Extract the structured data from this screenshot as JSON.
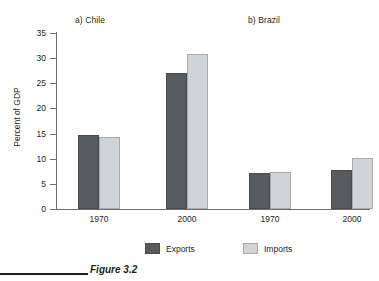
{
  "figure": {
    "caption": "Figure 3.2",
    "caption_rule": true
  },
  "legend": {
    "position": "bottom",
    "items": [
      {
        "label": "Exports",
        "color": "#595a5c"
      },
      {
        "label": "Imports",
        "color": "#d2d3d5"
      }
    ]
  },
  "chart_data": {
    "type": "bar",
    "title": "",
    "xlabel": "",
    "ylabel": "Percent of GDP",
    "ylim": [
      0,
      35
    ],
    "yticks": [
      0,
      5,
      10,
      15,
      20,
      25,
      30,
      35
    ],
    "ytick_labels": [
      "0",
      "5",
      "10",
      "15",
      "20",
      "25",
      "30",
      "35"
    ],
    "grid": false,
    "legend_position": "bottom",
    "panels": [
      {
        "title": "a) Chile",
        "categories": [
          "1970",
          "2000"
        ],
        "series": [
          {
            "name": "Exports",
            "color": "#595a5c",
            "values": [
              14.7,
              27.0
            ]
          },
          {
            "name": "Imports",
            "color": "#d2d3d5",
            "values": [
              14.4,
              30.9
            ]
          }
        ]
      },
      {
        "title": "b) Brazil",
        "categories": [
          "1970",
          "2000"
        ],
        "series": [
          {
            "name": "Exports",
            "color": "#595a5c",
            "values": [
              7.2,
              7.7
            ]
          },
          {
            "name": "Imports",
            "color": "#d2d3d5",
            "values": [
              7.4,
              10.1
            ]
          }
        ]
      }
    ]
  }
}
